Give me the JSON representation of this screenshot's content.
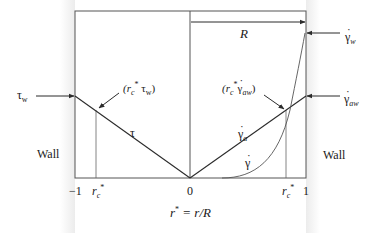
{
  "diagram": {
    "type": "velocity-profile-shear-diagram",
    "colors": {
      "line": "#2b2b2b",
      "frame": "#555555",
      "wall_shade": "#ececec"
    },
    "labels": {
      "R": "R",
      "tau_w": "τ",
      "tau_w_sub": "w",
      "tau": "τ",
      "point_left_open": "(r",
      "point_left_sub": "c",
      "point_left_sup": "*",
      "point_left_rest": " τ",
      "point_left_sub2": "w",
      "point_left_close": ")",
      "point_right_open": "(r",
      "point_right_sub": "c",
      "point_right_sup": "*",
      "point_right_rest": " γ",
      "point_right_sub2": "aw",
      "point_right_close": ")",
      "gamma_w": "γ",
      "gamma_w_sub": "w",
      "gamma_aw": "γ",
      "gamma_aw_sub": "aw",
      "gamma_a": "γ",
      "gamma_a_sub": "a",
      "gamma": "γ",
      "wall_left": "Wall",
      "wall_right": "Wall"
    },
    "x_axis": {
      "ticks": [
        "−1",
        "r",
        "0",
        "r",
        "1"
      ],
      "tick_rc_sub": "c",
      "tick_rc_sup": "*",
      "title_r": "r",
      "title_sup": "*",
      "title_rest": " = r/R"
    }
  }
}
